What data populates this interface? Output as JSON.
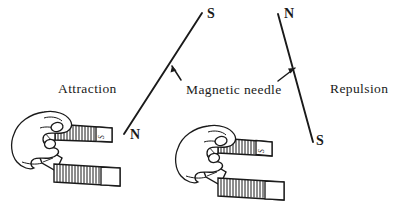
{
  "figure": {
    "background_color": "#ffffff",
    "ink_color": "#1a1a1a",
    "width": 406,
    "height": 203
  },
  "labels": {
    "attraction": "Attraction",
    "magnetic_needle": "Magnetic needle",
    "repulsion": "Repulsion"
  },
  "left_scene": {
    "caption": "Attraction",
    "needle": {
      "top_pole": "S",
      "bottom_pole": "N",
      "top_point": {
        "x": 202,
        "y": 13
      },
      "bottom_point": {
        "x": 124,
        "y": 134
      }
    },
    "magnet": {
      "type": "horseshoe-magnet",
      "upper_pole_label": "S",
      "lower_pole_label": ""
    },
    "hand": "hand-holding-magnet"
  },
  "right_scene": {
    "caption": "Repulsion",
    "needle": {
      "top_pole": "N",
      "bottom_pole": "S",
      "top_point": {
        "x": 278,
        "y": 14
      },
      "bottom_point": {
        "x": 313,
        "y": 142
      }
    },
    "magnet": {
      "type": "horseshoe-magnet",
      "upper_pole_label": "S",
      "lower_pole_label": ""
    },
    "hand": "hand-holding-magnet"
  },
  "pointers": {
    "left_arrow": "arrow-up-left-icon",
    "right_arrow": "arrow-up-right-icon"
  }
}
